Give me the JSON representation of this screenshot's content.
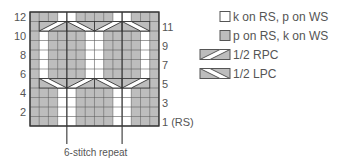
{
  "chart": {
    "grid": {
      "rows": 12,
      "cols": 14,
      "cell_w": 9.21,
      "cell_h": 9.5,
      "left": 30,
      "top": 12
    },
    "colors": {
      "knit": "#ffffff",
      "purl": "#bdbdbd",
      "line": "#5a5a5a",
      "border": "#333333"
    },
    "row_labels_left": [
      "12",
      "10",
      "8",
      "6",
      "4",
      "2"
    ],
    "row_labels_right": [
      "11",
      "9",
      "7",
      "5",
      "3",
      "1 (RS)"
    ],
    "rows": [
      {
        "row": 12,
        "cells": "PPPKKPPPPKKPPP"
      },
      {
        "row": 11,
        "cables": [
          {
            "type": "RPC",
            "start_col": 2
          },
          {
            "type": "LPC",
            "start_col": 5
          },
          {
            "type": "RPC",
            "start_col": 8
          },
          {
            "type": "LPC",
            "start_col": 11
          }
        ],
        "cells": "PXXXXXXXXXXXXP"
      },
      {
        "row": 10,
        "cells": "PKPPPPKKPPPPKP"
      },
      {
        "row": 9,
        "cells": "PKPPPPKKPPPPKP"
      },
      {
        "row": 8,
        "cells": "PKPPPPKKPPPPKP"
      },
      {
        "row": 7,
        "cells": "PKPPPPKKPPPPKP"
      },
      {
        "row": 6,
        "cells": "PKPPPPKKPPPPKP"
      },
      {
        "row": 5,
        "cables": [
          {
            "type": "LPC",
            "start_col": 2
          },
          {
            "type": "RPC",
            "start_col": 5
          },
          {
            "type": "LPC",
            "start_col": 8
          },
          {
            "type": "RPC",
            "start_col": 11
          }
        ],
        "cells": "PXXXXXXXXXXXXP"
      },
      {
        "row": 4,
        "cells": "PPPKKPPPPKKPPP"
      },
      {
        "row": 3,
        "cells": "PPPKKPPPPKKPPP"
      },
      {
        "row": 2,
        "cells": "PPPKKPPPPKKPPP"
      },
      {
        "row": 1,
        "cells": "PPPKKPPPPKKPPP"
      }
    ],
    "repeat": {
      "start_col": 5,
      "end_col": 10,
      "label": "6-stitch repeat"
    }
  },
  "legend": {
    "items": [
      {
        "symbol": "knit-square",
        "label": "k on RS, p on WS"
      },
      {
        "symbol": "purl-square",
        "label": "p on RS, k on WS"
      },
      {
        "symbol": "rpc-cable",
        "label": "1/2 RPC"
      },
      {
        "symbol": "lpc-cable",
        "label": "1/2 LPC"
      }
    ]
  }
}
